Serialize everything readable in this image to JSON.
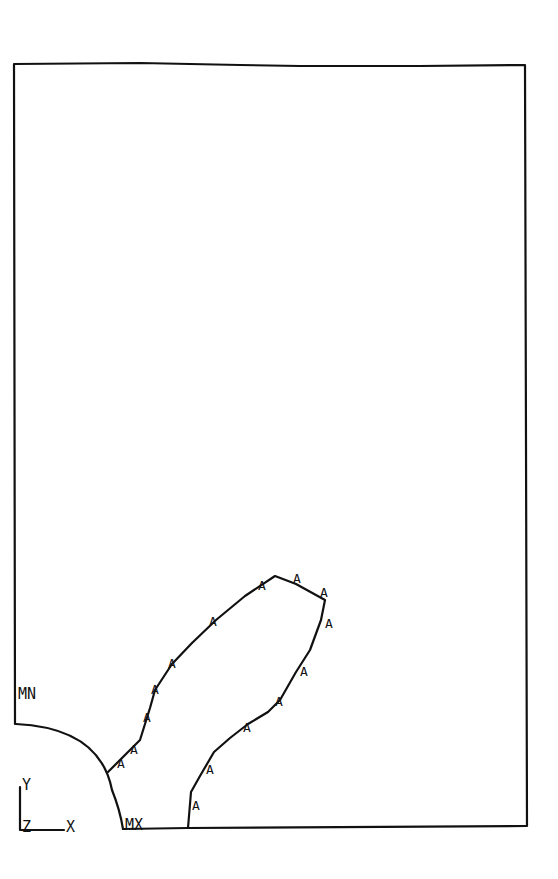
{
  "diagram": {
    "type": "fea-contour-plot",
    "line_color": "#111111",
    "background": "#ffffff",
    "labels": {
      "min": "MN",
      "max": "MX",
      "axis_y": "Y",
      "axis_z": "Z",
      "axis_x": "X"
    },
    "contour_label": "A",
    "contour_label_count": 20
  }
}
